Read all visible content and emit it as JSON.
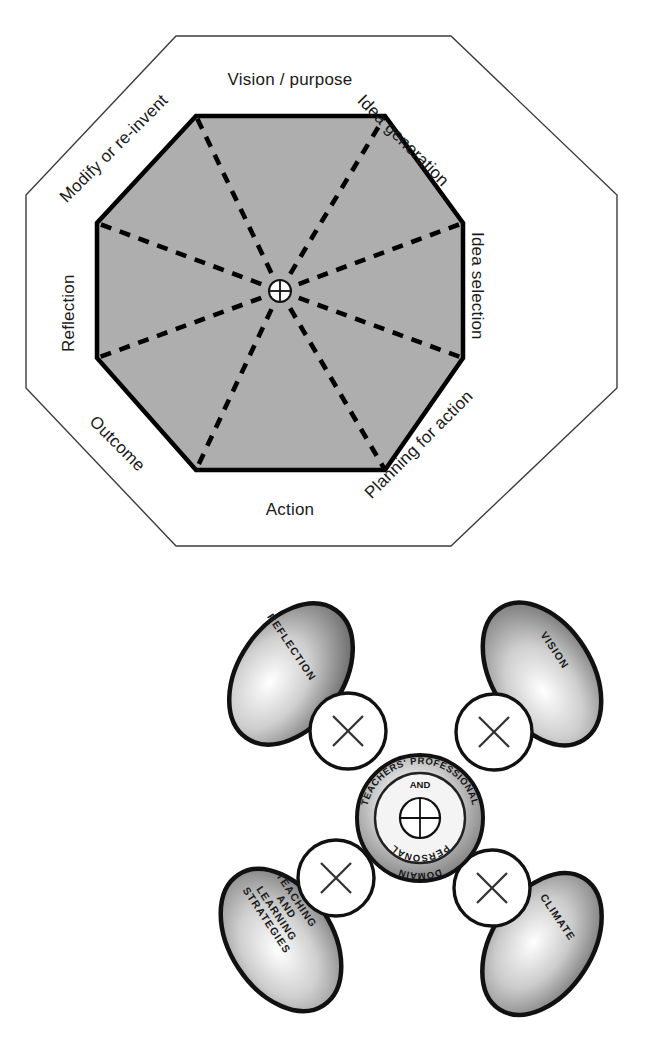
{
  "figure_creative_cycle": {
    "title_present": false,
    "shape": "octagon",
    "center_marker": "crosshair-circle",
    "fill_color": "#aeaeae",
    "border_color": "#000000",
    "outer_outline_color": "#3c3c3c",
    "segments": [
      {
        "id": "vision",
        "label": "Vision / purpose",
        "rotation": 0,
        "position": "top"
      },
      {
        "id": "idea-gen",
        "label": "Idea generation",
        "rotation": 45,
        "position": "top-right"
      },
      {
        "id": "idea-select",
        "label": "Idea selection",
        "rotation": 90,
        "position": "right"
      },
      {
        "id": "planning",
        "label": "Planning for action",
        "rotation": -45,
        "position": "bottom-right"
      },
      {
        "id": "action",
        "label": "Action",
        "rotation": 0,
        "position": "bottom"
      },
      {
        "id": "outcome",
        "label": "Outcome",
        "rotation": 45,
        "position": "bottom-left"
      },
      {
        "id": "reflection",
        "label": "Reflection",
        "rotation": -90,
        "position": "left"
      },
      {
        "id": "modify",
        "label": "Modify or re-invent",
        "rotation": -45,
        "position": "top-left"
      }
    ]
  },
  "figure_domain_model": {
    "center": {
      "outer_top_arc": "TEACHERS' PROFESSIONAL",
      "inner_top": "AND",
      "inner_bottom_arc": "PERSONAL",
      "outer_bottom_arc": "DOMAIN",
      "marker": "crosshair-circle"
    },
    "connectors": {
      "glyph": "×",
      "count": 4,
      "shape": "circle",
      "fill": "#ffffff",
      "stroke": "#111111"
    },
    "nodes": [
      {
        "id": "reflection",
        "lines": [
          "REFLECTION"
        ],
        "position": "top-left",
        "rotation": 56
      },
      {
        "id": "vision",
        "lines": [
          "VISION"
        ],
        "position": "top-right",
        "rotation": 56
      },
      {
        "id": "teaching",
        "lines": [
          "TEACHING",
          "AND",
          "LEARNING",
          "STRATEGIES"
        ],
        "position": "bottom-left",
        "rotation": 56
      },
      {
        "id": "climate",
        "lines": [
          "CLIMATE"
        ],
        "position": "bottom-right",
        "rotation": 56
      }
    ],
    "node_fill_light": "#ffffff",
    "node_fill_dark": "#6e6e6e",
    "node_stroke": "#111111"
  }
}
